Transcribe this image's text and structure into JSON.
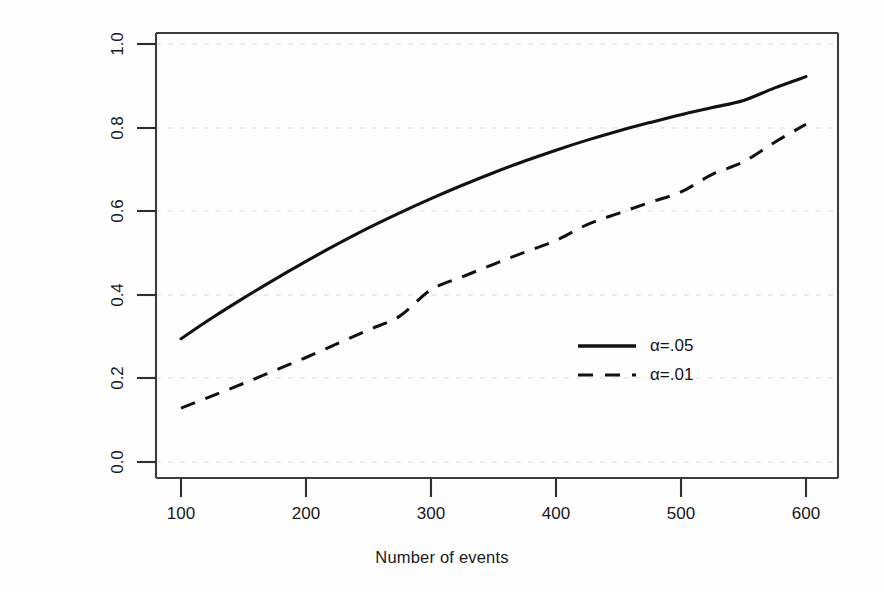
{
  "chart_data": {
    "type": "line",
    "title": "",
    "xlabel": "Number of events",
    "ylabel": "Power",
    "xlim": [
      85,
      615
    ],
    "ylim": [
      -0.04,
      1.03
    ],
    "xticks": [
      100,
      200,
      300,
      400,
      500,
      600
    ],
    "xtick_labels": [
      "100",
      "200",
      "300",
      "400",
      "500",
      "600"
    ],
    "yticks": [
      0.0,
      0.2,
      0.4,
      0.6,
      0.8,
      1.0
    ],
    "ytick_labels": [
      "0.0",
      "0.2",
      "0.4",
      "0.6",
      "0.8",
      "1.0"
    ],
    "grid": true,
    "grid_style": "dotted",
    "grid_color": "#e4e4e4",
    "legend_position": "center-right",
    "line_color": "#111111",
    "x": [
      100,
      125,
      150,
      175,
      200,
      225,
      250,
      275,
      300,
      325,
      350,
      375,
      400,
      425,
      450,
      475,
      500,
      525,
      550,
      575,
      600
    ],
    "series": [
      {
        "name": "alpha=.05",
        "label": "α=.05",
        "linestyle": "solid",
        "values": [
          0.295,
          0.345,
          0.392,
          0.437,
          0.48,
          0.521,
          0.56,
          0.596,
          0.63,
          0.662,
          0.692,
          0.72,
          0.746,
          0.77,
          0.792,
          0.812,
          0.831,
          0.848,
          0.865,
          0.895,
          0.922
        ]
      },
      {
        "name": "alpha=.01",
        "label": "α=.01",
        "linestyle": "dashed",
        "values": [
          0.129,
          0.158,
          0.188,
          0.219,
          0.25,
          0.283,
          0.316,
          0.349,
          0.412,
          0.443,
          0.473,
          0.502,
          0.53,
          0.568,
          0.595,
          0.621,
          0.646,
          0.688,
          0.718,
          0.765,
          0.808
        ]
      }
    ],
    "legend": [
      {
        "label": "α=.05",
        "linestyle": "solid"
      },
      {
        "label": "α=.01",
        "linestyle": "dashed"
      }
    ]
  },
  "axes": {
    "x_title": "Number of events",
    "y_title": "Power"
  }
}
